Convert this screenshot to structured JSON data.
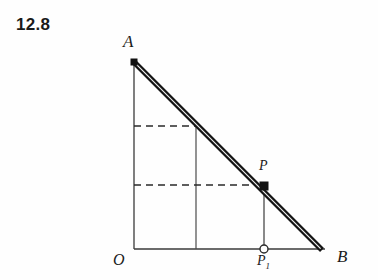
{
  "figure": {
    "problem_number": "12.8",
    "type": "geometry-diagram",
    "background_color": "#fefefe",
    "ink_color": "#1b1b1b",
    "labels": {
      "A": "A",
      "B": "B",
      "O": "O",
      "P": "P",
      "P1": "P",
      "P1_subscript": "1"
    },
    "points": [
      {
        "name": "A",
        "x": 134,
        "y": 62,
        "marker": "square-filled"
      },
      {
        "name": "B",
        "x": 322,
        "y": 250,
        "marker": "none"
      },
      {
        "name": "O",
        "x": 134,
        "y": 249,
        "marker": "none"
      },
      {
        "name": "P",
        "x": 264,
        "y": 186,
        "marker": "square-filled"
      },
      {
        "name": "P1",
        "x": 264,
        "y": 249,
        "marker": "circle-open"
      }
    ],
    "segments": [
      {
        "name": "vertical-axis-OA",
        "x1": 134,
        "y1": 62,
        "x2": 134,
        "y2": 249,
        "style": "solid-thin"
      },
      {
        "name": "horizontal-axis-OB",
        "x1": 134,
        "y1": 249,
        "x2": 324,
        "y2": 249,
        "style": "solid-thin"
      },
      {
        "name": "rod-AB",
        "x1": 134,
        "y1": 62,
        "x2": 322,
        "y2": 250,
        "style": "double-thick"
      },
      {
        "name": "vertical-construction-line",
        "x1": 196,
        "y1": 126,
        "x2": 196,
        "y2": 249,
        "style": "solid-thin"
      },
      {
        "name": "vertical-line-P-to-P1",
        "x1": 264,
        "y1": 186,
        "x2": 264,
        "y2": 249,
        "style": "solid-thin"
      },
      {
        "name": "dashed-line-upper",
        "x1": 134,
        "y1": 126,
        "x2": 197,
        "y2": 126,
        "style": "dashed"
      },
      {
        "name": "dashed-line-lower",
        "x1": 134,
        "y1": 185,
        "x2": 264,
        "y2": 185,
        "style": "dashed"
      }
    ]
  }
}
